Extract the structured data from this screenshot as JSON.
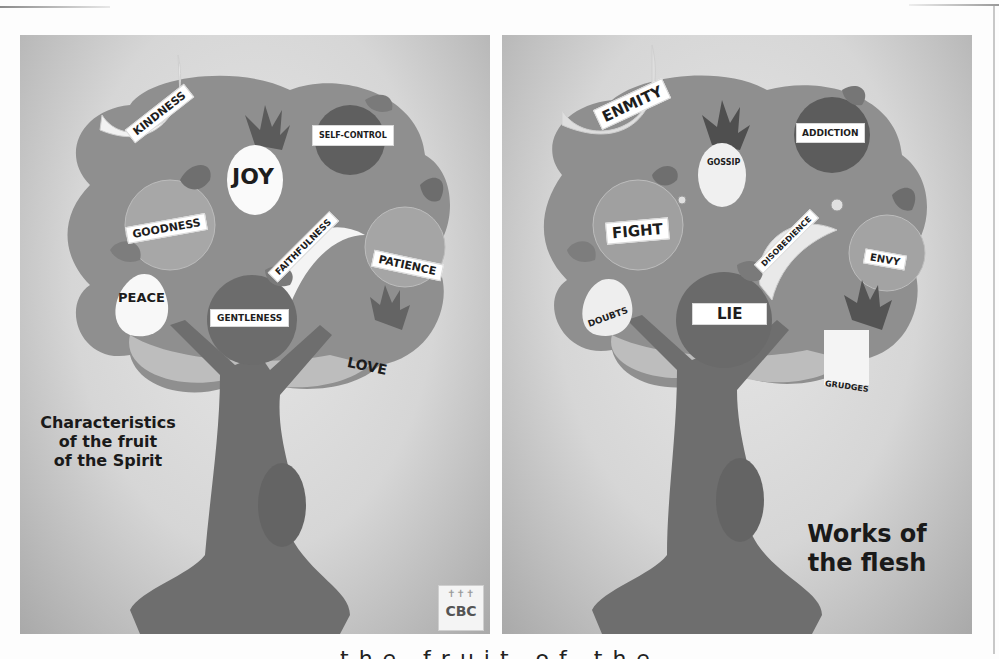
{
  "left_poster": {
    "caption": [
      "Characteristics",
      "of the fruit",
      "of the Spirit"
    ],
    "fruits": [
      {
        "name": "banana",
        "label": "KINDNESS"
      },
      {
        "name": "pineapple",
        "label": "JOY"
      },
      {
        "name": "apple",
        "label": "SELF-CONTROL"
      },
      {
        "name": "apple",
        "label": "GOODNESS"
      },
      {
        "name": "banana",
        "label": "FAITHFULNESS"
      },
      {
        "name": "apple",
        "label": "PATIENCE"
      },
      {
        "name": "pear",
        "label": "PEACE"
      },
      {
        "name": "apple",
        "label": "GENTLENESS"
      },
      {
        "name": "pineapple",
        "label": "LOVE"
      }
    ],
    "logo": "CBC"
  },
  "right_poster": {
    "caption": [
      "Works of",
      "the flesh"
    ],
    "fruits": [
      {
        "name": "banana",
        "label": "ENMITY"
      },
      {
        "name": "pineapple",
        "label": "GOSSIP"
      },
      {
        "name": "apple",
        "label": "ADDICTION"
      },
      {
        "name": "apple",
        "label": "FIGHT"
      },
      {
        "name": "banana",
        "label": "DISOBEDIENCE"
      },
      {
        "name": "apple",
        "label": "ENVY"
      },
      {
        "name": "pear",
        "label": "DOUBTS"
      },
      {
        "name": "apple",
        "label": "LIE"
      },
      {
        "name": "pineapple",
        "label": "GRUDGES"
      }
    ]
  },
  "footer_text_cut": "the fruit of the"
}
